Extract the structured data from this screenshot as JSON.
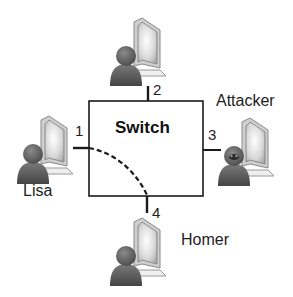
{
  "diagram": {
    "switch": {
      "label": "Switch"
    },
    "ports": [
      {
        "id": 1,
        "label": "1"
      },
      {
        "id": 2,
        "label": "2"
      },
      {
        "id": 3,
        "label": "3"
      },
      {
        "id": 4,
        "label": "4"
      }
    ],
    "nodes": {
      "top": {
        "label": "",
        "port": "2"
      },
      "left": {
        "label": "Lisa",
        "port": "1"
      },
      "right": {
        "label": "Attacker",
        "port": "3"
      },
      "bottom": {
        "label": "Homer",
        "port": "4"
      }
    },
    "connection": {
      "from_port": "1",
      "to_port": "4",
      "style": "dashed"
    },
    "colors": {
      "line": "#1a1a1a",
      "person": "#5a5a5a",
      "monitor_frame": "#9a9a9a",
      "monitor_screen": "#e6e6e6"
    }
  }
}
